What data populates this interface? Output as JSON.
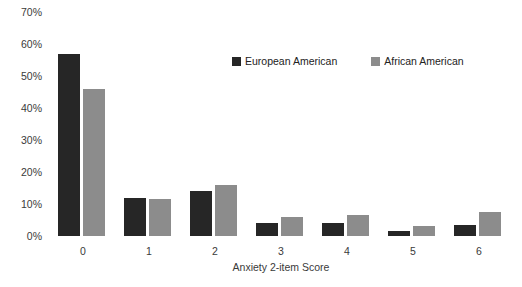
{
  "chart_data": {
    "type": "bar",
    "title": "",
    "subtitle": "",
    "xlabel": "Anxiety 2-item Score",
    "ylabel": "",
    "categories": [
      "0",
      "1",
      "2",
      "3",
      "4",
      "5",
      "6"
    ],
    "series": [
      {
        "name": "European American",
        "color": "#262626",
        "values": [
          57,
          12,
          14,
          4,
          4,
          1.5,
          3.5
        ]
      },
      {
        "name": "African American",
        "color": "#8c8c8c",
        "values": [
          46,
          11.5,
          16,
          6,
          6.5,
          3,
          7.5
        ]
      }
    ],
    "ylim": [
      0,
      70
    ],
    "ytick_values": [
      0,
      10,
      20,
      30,
      40,
      50,
      60,
      70
    ],
    "ytick_labels": [
      "0%",
      "10%",
      "20%",
      "30%",
      "40%",
      "50%",
      "60%",
      "70%"
    ],
    "grid": false,
    "legend_position": "top-center",
    "value_unit": "%"
  }
}
